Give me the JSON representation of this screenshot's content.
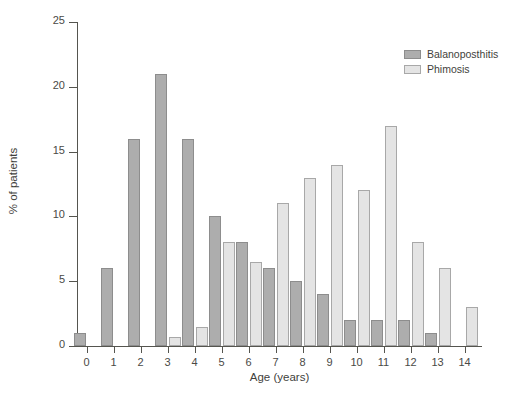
{
  "chart_data": {
    "type": "bar",
    "title": "",
    "subtitle": "",
    "xlabel": "Age (years)",
    "ylabel": "% of patients",
    "categories": [
      "0",
      "1",
      "2",
      "3",
      "4",
      "5",
      "6",
      "7",
      "8",
      "9",
      "10",
      "11",
      "12",
      "13",
      "14"
    ],
    "series": [
      {
        "name": "Balanoposthitis",
        "color": "#adadad",
        "values": [
          1,
          6,
          16,
          21,
          16,
          10,
          8,
          6,
          5,
          4,
          2,
          2,
          2,
          1,
          0
        ]
      },
      {
        "name": "Phimosis",
        "color": "#e4e4e4",
        "values": [
          0,
          0,
          0,
          0.7,
          1.5,
          8,
          6.5,
          11,
          13,
          14,
          12,
          17,
          8,
          6,
          3
        ]
      }
    ],
    "ylim": [
      0,
      25
    ],
    "yticks": [
      "0",
      "5",
      "10",
      "15",
      "20",
      "25"
    ],
    "ytick_values": [
      0,
      5,
      10,
      15,
      20,
      25
    ],
    "grid": false,
    "legend_position": "top-right"
  }
}
